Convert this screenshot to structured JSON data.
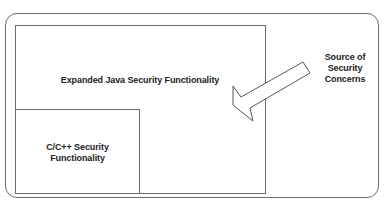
{
  "diagram": {
    "java_box": {
      "label": "Expanded Java Security Functionality"
    },
    "cpp_box": {
      "lines": [
        "C/C++ Security",
        "Functionality"
      ]
    },
    "source": {
      "lines": [
        "Source of",
        "Security",
        "Concerns"
      ]
    },
    "arrow": {
      "direction": "points from source label toward Java box",
      "fill": "#ffffff",
      "stroke": "#555555"
    },
    "colors": {
      "stroke": "#6a6a6a",
      "text": "#222222",
      "background": "#ffffff"
    }
  }
}
